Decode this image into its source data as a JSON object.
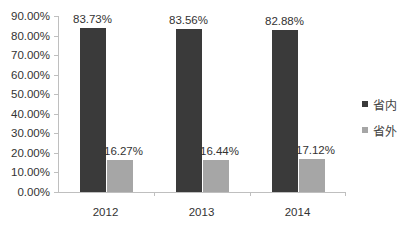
{
  "chart_data": {
    "type": "bar",
    "title": "",
    "xlabel": "",
    "ylabel": "",
    "categories": [
      "2012",
      "2013",
      "2014"
    ],
    "series": [
      {
        "name": "省内",
        "values": [
          83.73,
          83.56,
          82.88
        ],
        "labels": [
          "83.73%",
          "83.56%",
          "82.88%"
        ],
        "color": "#3a3a3a"
      },
      {
        "name": "省外",
        "values": [
          16.27,
          16.44,
          17.12
        ],
        "labels": [
          "16.27%",
          "16.44%",
          "17.12%"
        ],
        "color": "#a6a6a6"
      }
    ],
    "ylim": [
      0,
      90
    ],
    "yticks": [
      "0.00%",
      "10.00%",
      "20.00%",
      "30.00%",
      "40.00%",
      "50.00%",
      "60.00%",
      "70.00%",
      "80.00%",
      "90.00%"
    ],
    "grid": false,
    "legend_position": "right"
  }
}
